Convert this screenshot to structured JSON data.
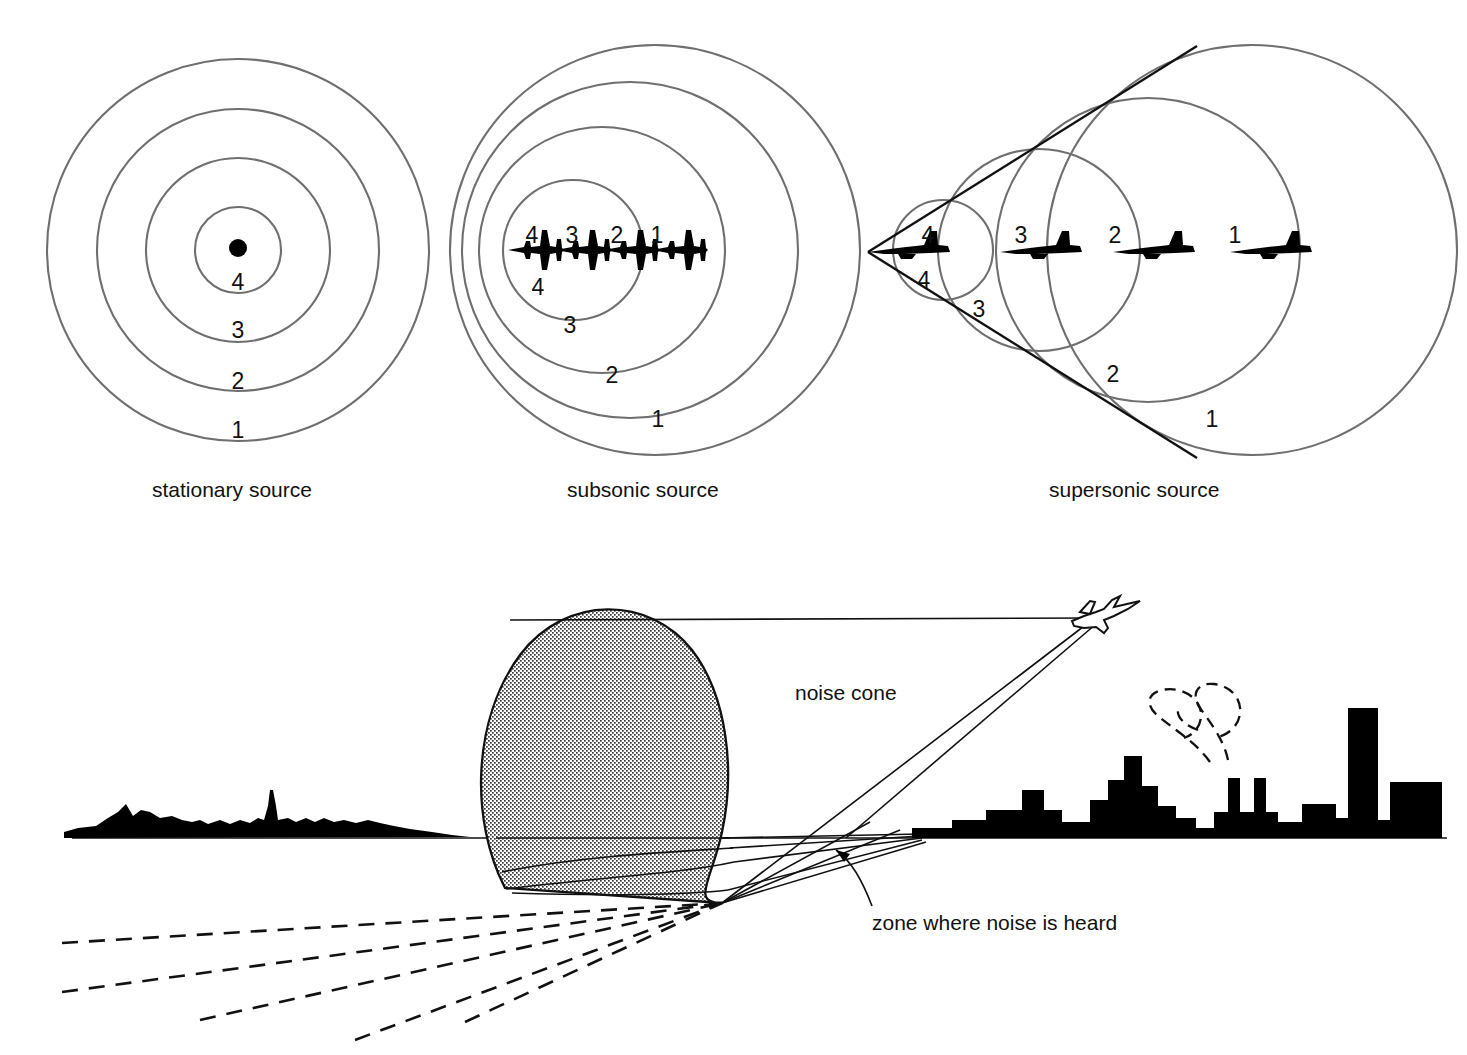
{
  "figure": {
    "background_color": "#ffffff",
    "wave_color": "#6f6f6f",
    "line_color": "#111111",
    "fill_color": "#000000"
  },
  "panels": [
    {
      "id": "stationary",
      "caption": "stationary source",
      "source_icon": "source-dot-icon",
      "wave_labels": [
        "4",
        "3",
        "2",
        "1"
      ],
      "wavefront_count": 4,
      "aircraft_count": 0,
      "description": "four concentric circles about a single point source"
    },
    {
      "id": "subsonic",
      "caption": "subsonic source",
      "source_icon": "jet-front-icon",
      "wave_labels": [
        "4",
        "3",
        "2",
        "1"
      ],
      "inner_label": "4",
      "aircraft_labels": [
        "4",
        "3",
        "2",
        "1"
      ],
      "wavefront_count": 4,
      "aircraft_count": 4,
      "description": "four nested non-concentric circles bunched ahead of the moving source"
    },
    {
      "id": "supersonic",
      "caption": "supersonic source",
      "source_icon": "jet-side-icon",
      "wave_labels": [
        "4",
        "3",
        "2",
        "1"
      ],
      "inner_label": "4",
      "aircraft_labels": [
        "4",
        "3",
        "2",
        "1"
      ],
      "wavefront_count": 4,
      "aircraft_count": 4,
      "mach_cone": true,
      "description": "four circles whose common tangent lines form the Mach cone with apex at the aircraft"
    }
  ],
  "scene": {
    "labels": {
      "noise_cone": "noise cone",
      "zone_where_noise_is_heard": "zone where noise is heard"
    },
    "elements": [
      "hills-silhouette",
      "noise-cone-stippled",
      "ground-line",
      "city-skyline",
      "smoke-plume",
      "aircraft-outline",
      "ray-lines",
      "dashed-ground-track"
    ]
  }
}
